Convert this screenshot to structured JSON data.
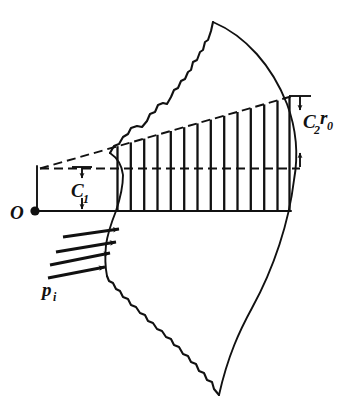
{
  "figure": {
    "kind": "engineering-diagram",
    "background_color": "#ffffff",
    "ink_color": "#111111"
  },
  "labels": {
    "origin": {
      "text": "O",
      "name": "origin-label"
    },
    "inner_dimension": {
      "base": "C",
      "sub": "1",
      "name": "c1-dimension-label"
    },
    "outer_dimension": {
      "base": "C",
      "sub": "2",
      "base2": "r",
      "sub2": "0",
      "name": "c2r0-dimension-label"
    },
    "pressure": {
      "base": "p",
      "sub": "i",
      "name": "pressure-label"
    }
  },
  "geometry": {
    "origin_point": {
      "x": 35,
      "y": 211
    },
    "baseline_y": 211,
    "centerline_y": 168,
    "hatch_start_x": 116,
    "hatch_end_x": 290,
    "hatch_count": 14,
    "slope_line_left": {
      "x": 40,
      "y": 168
    },
    "slope_line_right": {
      "x": 290,
      "y": 97
    },
    "inner_radius": 118,
    "outer_radius": 256
  },
  "elements": {
    "arrows": {
      "pressure_arrow_count": 4,
      "dimension_arrow_count": 4
    },
    "curves": {
      "inner_arc": "inner-arc",
      "outer_arc": "outer-arc",
      "upper_break": "upper-break-line",
      "lower_break": "lower-break-line"
    },
    "lines": {
      "baseline": "baseline",
      "centerline_dashed": "dashed-centerline",
      "slope_dashed": "dashed-slope-line",
      "left_extension": "left-extension-line",
      "right_extension_top": "right-extension-top",
      "right_extension_bottom": "right-extension-bottom"
    }
  }
}
